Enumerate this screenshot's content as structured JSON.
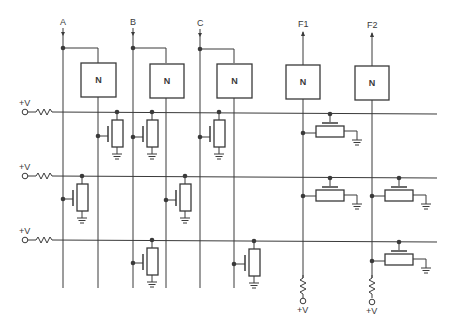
{
  "diagram": {
    "type": "circuit-schematic",
    "inputs": [
      {
        "id": "A",
        "label": "A"
      },
      {
        "id": "B",
        "label": "B"
      },
      {
        "id": "C",
        "label": "C"
      }
    ],
    "outputs": [
      {
        "id": "F1",
        "label": "F1"
      },
      {
        "id": "F2",
        "label": "F2"
      }
    ],
    "inverters": [
      {
        "label": "N"
      },
      {
        "label": "N"
      },
      {
        "label": "N"
      },
      {
        "label": "N"
      },
      {
        "label": "N"
      }
    ],
    "supply_label": "+V",
    "rows": [
      {
        "supply_label": "+V"
      },
      {
        "supply_label": "+V"
      },
      {
        "supply_label": "+V"
      }
    ],
    "bottom_supplies": [
      {
        "label": "+V"
      },
      {
        "label": "+V"
      }
    ]
  }
}
